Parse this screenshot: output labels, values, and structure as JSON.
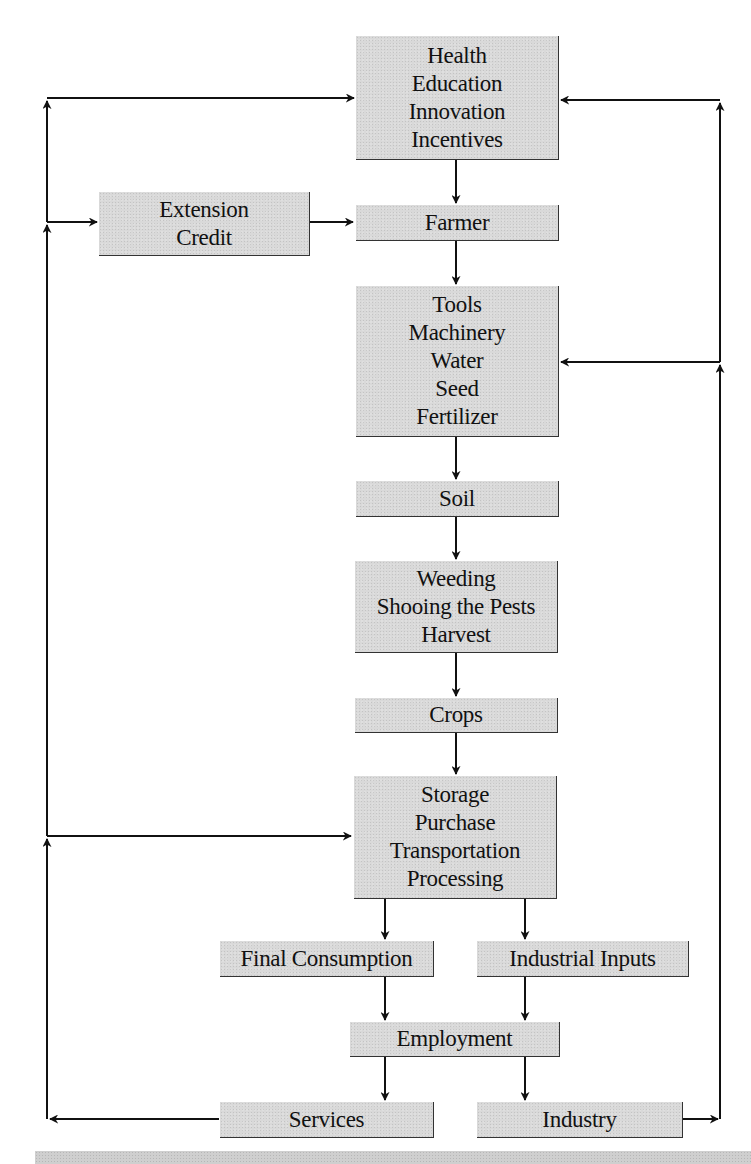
{
  "diagram": {
    "type": "flowchart",
    "colors": {
      "box_fill": "#d9d9d9",
      "line": "#111111",
      "text": "#111111"
    },
    "nodes": [
      {
        "id": "health",
        "lines": [
          "Health",
          "Education",
          "Innovation",
          "Incentives"
        ]
      },
      {
        "id": "extension",
        "lines": [
          "Extension",
          "Credit"
        ]
      },
      {
        "id": "farmer",
        "lines": [
          "Farmer"
        ]
      },
      {
        "id": "tools",
        "lines": [
          "Tools",
          "Machinery",
          "Water",
          "Seed",
          "Fertilizer"
        ]
      },
      {
        "id": "soil",
        "lines": [
          "Soil"
        ]
      },
      {
        "id": "weeding",
        "lines": [
          "Weeding",
          "Shooing the Pests",
          "Harvest"
        ]
      },
      {
        "id": "crops",
        "lines": [
          "Crops"
        ]
      },
      {
        "id": "storage",
        "lines": [
          "Storage",
          "Purchase",
          "Transportation",
          "Processing"
        ]
      },
      {
        "id": "final_consumption",
        "lines": [
          "Final Consumption"
        ]
      },
      {
        "id": "industrial_inputs",
        "lines": [
          "Industrial Inputs"
        ]
      },
      {
        "id": "employment",
        "lines": [
          "Employment"
        ]
      },
      {
        "id": "services",
        "lines": [
          "Services"
        ]
      },
      {
        "id": "industry",
        "lines": [
          "Industry"
        ]
      }
    ],
    "edges": [
      {
        "from": "health",
        "to": "farmer"
      },
      {
        "from": "extension",
        "to": "farmer"
      },
      {
        "from": "farmer",
        "to": "tools"
      },
      {
        "from": "tools",
        "to": "soil"
      },
      {
        "from": "soil",
        "to": "weeding"
      },
      {
        "from": "weeding",
        "to": "crops"
      },
      {
        "from": "crops",
        "to": "storage"
      },
      {
        "from": "storage",
        "to": "final_consumption"
      },
      {
        "from": "storage",
        "to": "industrial_inputs"
      },
      {
        "from": "final_consumption",
        "to": "employment"
      },
      {
        "from": "industrial_inputs",
        "to": "employment"
      },
      {
        "from": "employment",
        "to": "services"
      },
      {
        "from": "employment",
        "to": "industry"
      },
      {
        "from": "services",
        "to": "health",
        "route": "left feedback loop"
      },
      {
        "from": "services",
        "to": "extension",
        "route": "left feedback loop"
      },
      {
        "from": "services",
        "to": "storage",
        "route": "left feedback loop"
      },
      {
        "from": "industry",
        "to": "health",
        "route": "right feedback loop"
      },
      {
        "from": "industry",
        "to": "tools",
        "route": "right feedback loop"
      }
    ]
  }
}
